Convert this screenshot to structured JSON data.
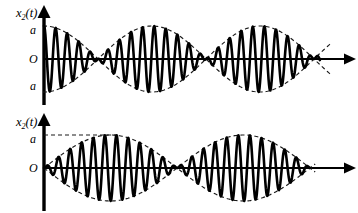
{
  "figure": {
    "title": "",
    "background_color": "#ffffff",
    "line_color": "#000000",
    "envelope_color": "#1a1a1a",
    "width": 358,
    "height": 213
  },
  "chart_data": {
    "type": "line",
    "title": "",
    "xlabel": "",
    "ylabel": "",
    "grid": false,
    "legend": "none",
    "panels": [
      {
        "id": "panel-top",
        "axis_label": "x₂(t)",
        "axis_label_base": "x",
        "axis_label_subscript": "2",
        "axis_label_suffix": "(t)",
        "y_ticks": [
          {
            "label": "a",
            "value": 1
          },
          {
            "label": "O",
            "value": 0
          },
          {
            "label": "a",
            "value": -1
          }
        ],
        "description": "Beat waveform: carrier oscillation modulated by a cosine envelope starting at maximum amplitude a, with nodes (zero amplitude) along the t axis.",
        "envelope": {
          "form": "a*cos(pi*(t - t0)/T_beat)",
          "amplitude": 1.0,
          "phase": "antinode-at-origin",
          "beat_half_period_px": 108,
          "node_positions_px": [
            152,
            260
          ],
          "antinode_positions_px": [
            44,
            206,
            314
          ]
        },
        "carrier": {
          "cycles_visible": 24,
          "period_px": 11.6
        },
        "x_axis": {
          "origin_px": 44,
          "baseline_y_px": 59,
          "end_px": 350,
          "arrow": true
        },
        "y_axis": {
          "x_px": 44,
          "top_px": 10,
          "bottom_px": 104,
          "arrow": true
        },
        "amplitude_px": 33,
        "wave_end_px": 320
      },
      {
        "id": "panel-bottom",
        "axis_label": "x₂(t)",
        "axis_label_base": "x",
        "axis_label_subscript": "2",
        "axis_label_suffix": "(t)",
        "y_ticks": [
          {
            "label": "a",
            "value": 1
          },
          {
            "label": "O",
            "value": 0
          }
        ],
        "description": "Beat waveform: carrier oscillation modulated by a sine envelope starting at a node (zero amplitude) at the origin, swelling to amplitude a and returning to nodes.",
        "envelope": {
          "form": "a*sin(pi*t/T_beat)",
          "amplitude": 1.0,
          "phase": "node-at-origin",
          "beat_half_period_px": 133,
          "node_positions_px": [
            44,
            190,
            310
          ],
          "antinode_positions_px": [
            117,
            250
          ]
        },
        "carrier": {
          "cycles_visible": 23,
          "period_px": 11.6
        },
        "x_axis": {
          "origin_px": 44,
          "baseline_y_px": 62,
          "end_px": 350,
          "arrow": true
        },
        "y_axis": {
          "x_px": 44,
          "top_px": 12,
          "bottom_px": 104,
          "arrow": true
        },
        "amplitude_px": 33,
        "wave_end_px": 310,
        "max_guide_line": true
      }
    ]
  },
  "labels": {
    "panel1_axis": "x",
    "panel1_sub": "2",
    "panel1_suffix": "(t)",
    "panel1_a_top": "a",
    "panel1_O": "O",
    "panel1_a_bottom": "a",
    "panel2_axis": "x",
    "panel2_sub": "2",
    "panel2_suffix": "(t)",
    "panel2_a": "a",
    "panel2_O": "O"
  }
}
